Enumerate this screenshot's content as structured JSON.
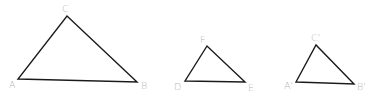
{
  "diagram": {
    "stroke_color": "#1a1a1a",
    "label_color": "#b5b5b5",
    "triangles": [
      {
        "name": "ABC",
        "vertices": [
          {
            "label": "A",
            "x": 18,
            "y": 79,
            "lx": 9,
            "ly": 88
          },
          {
            "label": "B",
            "x": 137,
            "y": 82,
            "lx": 141,
            "ly": 89
          },
          {
            "label": "C",
            "x": 67,
            "y": 16,
            "lx": 62,
            "ly": 12
          }
        ]
      },
      {
        "name": "DEF",
        "vertices": [
          {
            "label": "D",
            "x": 185,
            "y": 81,
            "lx": 174,
            "ly": 90
          },
          {
            "label": "E",
            "x": 245,
            "y": 82,
            "lx": 248,
            "ly": 91
          },
          {
            "label": "F",
            "x": 207,
            "y": 46,
            "lx": 200,
            "ly": 43
          }
        ]
      },
      {
        "name": "A'B'C'",
        "vertices": [
          {
            "label": "A'",
            "x": 296,
            "y": 82,
            "lx": 284,
            "ly": 89
          },
          {
            "label": "B'",
            "x": 354,
            "y": 84,
            "lx": 357,
            "ly": 90
          },
          {
            "label": "C'",
            "x": 316,
            "y": 45,
            "lx": 311,
            "ly": 41
          }
        ]
      }
    ]
  }
}
